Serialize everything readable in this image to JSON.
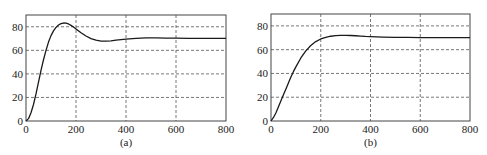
{
  "chart_data": [
    {
      "type": "line",
      "caption": "(a)",
      "title": "",
      "xlabel": "",
      "ylabel": "",
      "xlim": [
        0,
        800
      ],
      "ylim": [
        0,
        90
      ],
      "xticks": [
        0,
        200,
        400,
        600,
        800
      ],
      "yticks": [
        0,
        20,
        40,
        60,
        80
      ],
      "grid": true,
      "grid_style": "dashed",
      "legend": null,
      "series": [
        {
          "name": "response",
          "x": [
            0,
            10,
            20,
            30,
            40,
            50,
            60,
            70,
            80,
            90,
            100,
            110,
            120,
            130,
            140,
            150,
            160,
            170,
            180,
            190,
            200,
            220,
            240,
            260,
            280,
            300,
            320,
            340,
            360,
            380,
            400,
            440,
            480,
            520,
            560,
            600,
            650,
            700,
            750,
            800
          ],
          "y": [
            0,
            2,
            7,
            14,
            23,
            33,
            43,
            52,
            60,
            67,
            72.5,
            76.5,
            79.5,
            81.5,
            82.7,
            83.2,
            83.1,
            82.4,
            81.2,
            79.8,
            78.2,
            75,
            72.2,
            70,
            68.6,
            67.9,
            67.8,
            68.1,
            68.6,
            69.1,
            69.6,
            70.2,
            70.5,
            70.5,
            70.4,
            70.3,
            70.2,
            70.2,
            70.2,
            70.2
          ]
        }
      ]
    },
    {
      "type": "line",
      "caption": "(b)",
      "title": "",
      "xlabel": "",
      "ylabel": "",
      "xlim": [
        0,
        800
      ],
      "ylim": [
        0,
        90
      ],
      "xticks": [
        0,
        200,
        400,
        600,
        800
      ],
      "yticks": [
        0,
        20,
        40,
        60,
        80
      ],
      "grid": true,
      "grid_style": "dashed",
      "legend": null,
      "series": [
        {
          "name": "response",
          "x": [
            0,
            10,
            20,
            30,
            40,
            50,
            60,
            70,
            80,
            90,
            100,
            120,
            140,
            160,
            180,
            200,
            220,
            240,
            260,
            280,
            300,
            320,
            340,
            360,
            380,
            400,
            450,
            500,
            550,
            600,
            650,
            700,
            750,
            800
          ],
          "y": [
            0,
            3,
            7,
            12,
            17,
            22,
            27,
            32,
            37,
            41.5,
            45.5,
            53,
            59,
            63.5,
            66.8,
            69,
            70.4,
            71.3,
            71.8,
            72,
            72,
            71.9,
            71.7,
            71.4,
            71.1,
            70.9,
            70.6,
            70.4,
            70.3,
            70.2,
            70.2,
            70.2,
            70.2,
            70.2
          ]
        }
      ]
    }
  ],
  "panels": [
    {
      "caption": "(a)",
      "xtick_labels": [
        "0",
        "200",
        "400",
        "600",
        "800"
      ],
      "ytick_labels": [
        "0",
        "20",
        "40",
        "60",
        "80"
      ]
    },
    {
      "caption": "(b)",
      "xtick_labels": [
        "0",
        "200",
        "400",
        "600",
        "800"
      ],
      "ytick_labels": [
        "0",
        "20",
        "40",
        "60",
        "80"
      ]
    }
  ],
  "colors": {
    "axis": "#444444",
    "grid": "#555555",
    "line": "#1a1a1a",
    "text": "#222222"
  }
}
